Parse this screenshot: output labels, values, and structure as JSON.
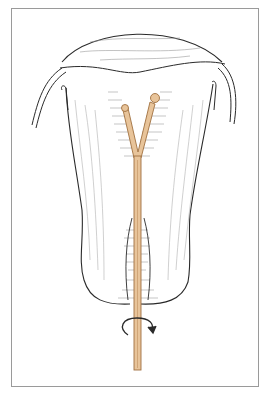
{
  "illustration": {
    "subject": "uterus cross-section with Y-shaped intrauterine device and insertion rod",
    "colors": {
      "outline": "#2a2a2a",
      "hatching": "#8a8a8a",
      "device_fill": "#e8c49a",
      "device_edge": "#a07040",
      "frame_border": "#9a9a9a"
    },
    "annotations": {
      "rotation_arrow": "curved-arrow-rotation"
    }
  }
}
